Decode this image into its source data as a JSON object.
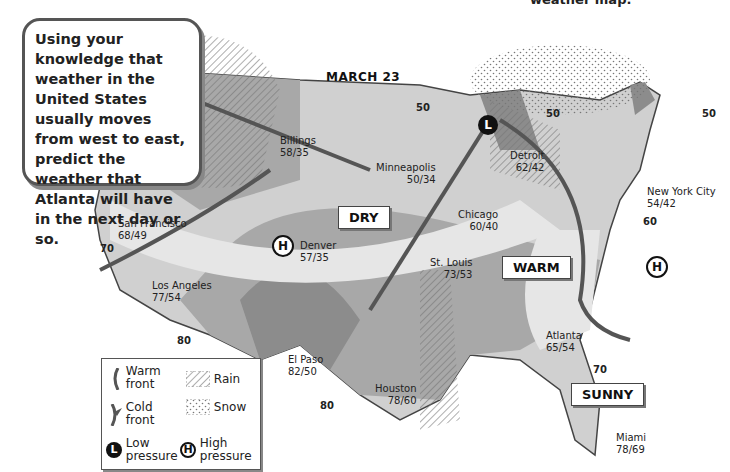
{
  "header": {
    "partial_title": "weather map."
  },
  "callout": {
    "text": "Using your knowledge that weather in the United States usually moves from west to east, predict the weather that Atlanta will have in the next day or so."
  },
  "map": {
    "title": "MARCH 23",
    "region_labels": {
      "dry": "DRY",
      "warm": "WARM",
      "sunny": "SUNNY"
    },
    "cities": [
      {
        "name": "Billings",
        "temps": "58/35"
      },
      {
        "name": "Minneapolis",
        "temps": "50/34"
      },
      {
        "name": "Detroit",
        "temps": "62/42"
      },
      {
        "name": "New York City",
        "temps": "54/42"
      },
      {
        "name": "Chicago",
        "temps": "60/40"
      },
      {
        "name": "San Francisco",
        "temps": "68/49"
      },
      {
        "name": "Denver",
        "temps": "57/35"
      },
      {
        "name": "St. Louis",
        "temps": "73/53"
      },
      {
        "name": "Los Angeles",
        "temps": "77/54"
      },
      {
        "name": "Atlanta",
        "temps": "65/54"
      },
      {
        "name": "El Paso",
        "temps": "82/50"
      },
      {
        "name": "Houston",
        "temps": "78/60"
      },
      {
        "name": "Miami",
        "temps": "78/69"
      }
    ],
    "isotherms": [
      "50",
      "50",
      "50",
      "60",
      "70",
      "70",
      "80",
      "80"
    ],
    "pressure_symbols": {
      "low": "L",
      "high": "H"
    }
  },
  "legend": {
    "warm_front": "Warm front",
    "cold_front": "Cold front",
    "rain": "Rain",
    "snow": "Snow",
    "low_pressure": "Low pressure",
    "high_pressure": "High pressure"
  },
  "colors": {
    "light": "#dcdcdc",
    "medium": "#b4b4b4",
    "dark": "#8c8c8c",
    "front": "#555555"
  }
}
